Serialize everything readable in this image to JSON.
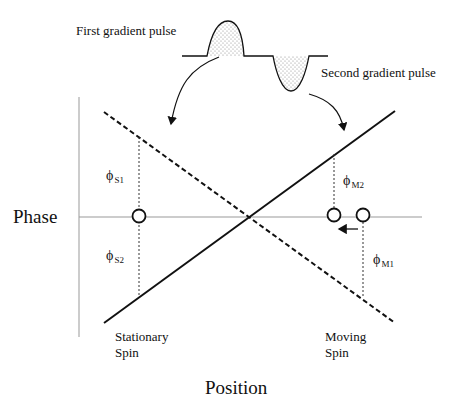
{
  "labels": {
    "first_pulse": "First gradient pulse",
    "second_pulse": "Second gradient pulse",
    "y_axis": "Phase",
    "x_axis": "Position",
    "stationary_line1": "Stationary",
    "stationary_line2": "Spin",
    "moving_line1": "Moving",
    "moving_line2": "Spin"
  },
  "phase_labels": {
    "s1": {
      "symbol": "ϕ",
      "sub": "S1"
    },
    "s2": {
      "symbol": "ϕ",
      "sub": "S2"
    },
    "m1": {
      "symbol": "ϕ",
      "sub": "M1"
    },
    "m2": {
      "symbol": "ϕ",
      "sub": "M2"
    }
  },
  "colors": {
    "ink": "#111111",
    "axis": "#999999",
    "stipple": "#888888"
  }
}
